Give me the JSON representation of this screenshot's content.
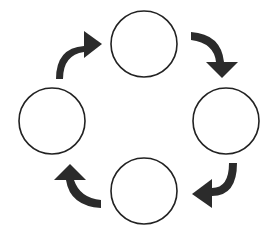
{
  "diagram": {
    "type": "cycle",
    "nodes": [
      {
        "id": "top",
        "label": "",
        "cx": 144,
        "cy": 44
      },
      {
        "id": "right",
        "label": "",
        "cx": 226,
        "cy": 121
      },
      {
        "id": "bottom",
        "label": "",
        "cx": 144,
        "cy": 191
      },
      {
        "id": "left",
        "label": "",
        "cx": 52,
        "cy": 121
      }
    ],
    "node_radius": 33,
    "edges": [
      {
        "from": "left",
        "to": "top"
      },
      {
        "from": "top",
        "to": "right"
      },
      {
        "from": "right",
        "to": "bottom"
      },
      {
        "from": "bottom",
        "to": "left"
      }
    ],
    "colors": {
      "node_stroke": "#222222",
      "node_fill": "#ffffff",
      "arrow": "#2b2b2b"
    }
  }
}
